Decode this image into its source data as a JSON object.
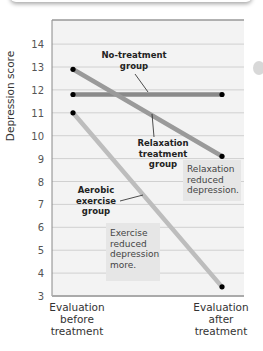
{
  "chart_data": {
    "type": "line",
    "title": "",
    "xlabel": "",
    "ylabel": "Depression score",
    "ylim": [
      3,
      15
    ],
    "yticks": [
      3,
      4,
      5,
      6,
      7,
      8,
      9,
      10,
      11,
      12,
      13,
      14
    ],
    "categories": [
      "Evaluation before treatment",
      "Evaluation after treatment"
    ],
    "category_lines": [
      [
        "Evaluation",
        "before",
        "treatment"
      ],
      [
        "Evaluation",
        "after",
        "treatment"
      ]
    ],
    "series": [
      {
        "name": "No-treatment group",
        "values": [
          11.8,
          11.8
        ],
        "color": "#8a8a8a"
      },
      {
        "name": "Relaxation treatment group",
        "values": [
          12.9,
          9.1
        ],
        "color": "#9a9a9a"
      },
      {
        "name": "Aerobic exercise group",
        "values": [
          11.0,
          3.4
        ],
        "color": "#bdbdbd"
      }
    ],
    "grid": true,
    "legend": "none (inline labels)",
    "labels": {
      "no_treatment": [
        "No-treatment",
        "group"
      ],
      "relaxation": [
        "Relaxation",
        "treatment",
        "group"
      ],
      "aerobic": [
        "Aerobic",
        "exercise",
        "group"
      ]
    },
    "annotations": [
      {
        "lines": [
          "Relaxation",
          "reduced",
          "depression."
        ]
      },
      {
        "lines": [
          "Exercise",
          "reduced",
          "depression",
          "more."
        ]
      }
    ]
  }
}
